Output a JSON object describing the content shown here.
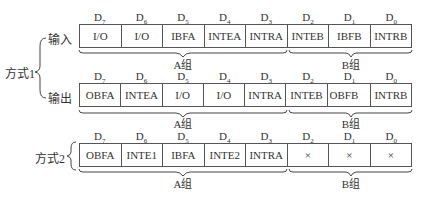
{
  "bit_labels": [
    "D7",
    "D6",
    "D5",
    "D4",
    "D3",
    "D2",
    "D1",
    "D0"
  ],
  "bit_subscripts": [
    "7",
    "6",
    "5",
    "4",
    "3",
    "2",
    "1",
    "0"
  ],
  "mode1": {
    "label": "方式1",
    "input": {
      "label": "输入",
      "cells": [
        "I/O",
        "I/O",
        "IBFA",
        "INTEA",
        "INTRA",
        "INTEB",
        "IBFB",
        "INTRB"
      ],
      "group_a": "A组",
      "group_b": "B组"
    },
    "output": {
      "label": "输出",
      "cells": [
        "OBFA",
        "INTEA",
        "I/O",
        "I/O",
        "INTRA",
        "INTEB",
        "OBFB",
        "INTRB"
      ],
      "group_a": "A组",
      "group_b": "B组"
    }
  },
  "mode2": {
    "label": "方式2",
    "cells": [
      "OBFA",
      "INTE1",
      "IBFA",
      "INTE2",
      "INTRA",
      "×",
      "×",
      "×"
    ],
    "group_a": "A组",
    "group_b": "B组"
  }
}
